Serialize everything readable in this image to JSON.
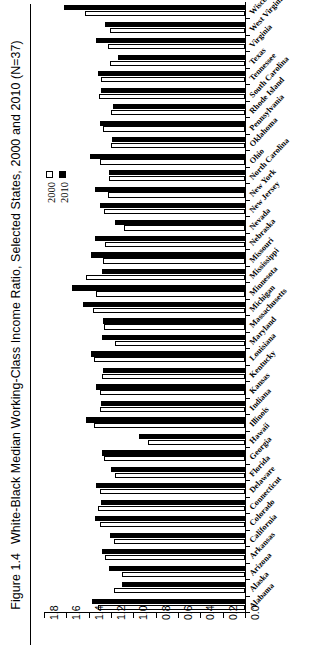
{
  "figure": {
    "number": "Figure 1.4",
    "caption": "White-Black Median Working-Class Income Ratio, Selected States, 2000 and 2010 (N=37)"
  },
  "legend": {
    "position": "inside-left",
    "entries": [
      {
        "label": "2000",
        "swatch": "open-square",
        "color": "#ffffff"
      },
      {
        "label": "2010",
        "swatch": "filled-square",
        "color": "#000000"
      }
    ]
  },
  "chart_data": {
    "type": "bar",
    "orientation": "horizontal",
    "title": "White-Black Median Working-Class Income Ratio, Selected States, 2000 and 2010 (N=37)",
    "xlabel": "",
    "ylabel": "",
    "xlim": [
      1.8,
      0.0
    ],
    "x_reversed": true,
    "xticks": [
      "1.8",
      "1.6",
      "1.4",
      "1.2",
      "1.0",
      "0.8",
      "0.6",
      "0.4",
      "0.2",
      "0.0"
    ],
    "grid": false,
    "legend_position": "inside-left",
    "n": 37,
    "categories": [
      "Alabama",
      "Alaska",
      "Arizona",
      "Arkansas",
      "California",
      "Colorado",
      "Connecticut",
      "Delaware",
      "Florida",
      "Georgia",
      "Hawaii",
      "Illinois",
      "Indiana",
      "Kansas",
      "Kentucky",
      "Louisiana",
      "Maryland",
      "Massachusetts",
      "Michigan",
      "Minnesota",
      "Mississippi",
      "Missouri",
      "Nebraska",
      "Nevada",
      "New Jersey",
      "New York",
      "North Carolina",
      "Ohio",
      "Oklahoma",
      "Pennsylvania",
      "Rhode Island",
      "South Carolina",
      "Tennessee",
      "Texas",
      "Virginia",
      "West Virginia",
      "Wisconsin"
    ],
    "series": [
      {
        "name": "2000",
        "color": "#ffffff",
        "values": [
          1.32,
          1.17,
          1.1,
          1.25,
          1.17,
          1.3,
          1.32,
          1.3,
          1.16,
          1.26,
          0.87,
          1.35,
          1.3,
          1.3,
          1.28,
          1.35,
          1.16,
          1.26,
          1.36,
          1.33,
          1.42,
          1.27,
          1.25,
          1.08,
          1.26,
          1.23,
          1.22,
          1.3,
          1.2,
          1.27,
          1.2,
          1.31,
          1.29,
          1.21,
          1.23,
          1.21,
          1.43
        ]
      },
      {
        "name": "2010",
        "color": "#000000",
        "values": [
          1.37,
          1.1,
          1.22,
          1.28,
          1.21,
          1.34,
          1.29,
          1.33,
          1.2,
          1.28,
          0.95,
          1.42,
          1.29,
          1.33,
          1.27,
          1.38,
          1.28,
          1.27,
          1.45,
          1.55,
          1.28,
          1.38,
          1.34,
          1.16,
          1.3,
          1.34,
          1.22,
          1.39,
          1.19,
          1.3,
          1.18,
          1.29,
          1.32,
          1.14,
          1.33,
          1.25,
          1.62
        ]
      }
    ]
  }
}
